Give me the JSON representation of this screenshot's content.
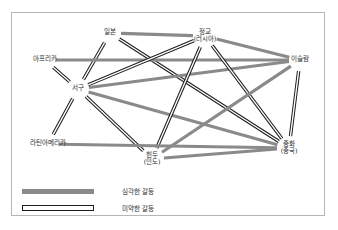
{
  "figure": {
    "title": "",
    "frame": {
      "stroke": "#b6b6b6"
    }
  },
  "colors": {
    "serious_conflict": "#8a8a8a",
    "weak_conflict_stroke": "#1d1d1d",
    "weak_conflict_fill": "#ffffff",
    "text": "#2b2b2b",
    "background": "#ffffff"
  },
  "legend": {
    "items": [
      {
        "key": "serious",
        "style": "solid-gray",
        "label": "심각한 갈등"
      },
      {
        "key": "weak",
        "style": "hollow-outline",
        "label": "미약한 갈등"
      }
    ]
  },
  "chart_data": {
    "type": "diagram",
    "subtype": "node-link-graph",
    "title": "",
    "nodes": [
      {
        "id": "japan",
        "label": "일본",
        "sub": "",
        "x": 110,
        "y": 33
      },
      {
        "id": "orthodox",
        "label": "정교",
        "sub": "(러시아)",
        "x": 205,
        "y": 36
      },
      {
        "id": "islam",
        "label": "이슬람",
        "sub": "",
        "x": 300,
        "y": 60
      },
      {
        "id": "africa",
        "label": "아프리카",
        "sub": "",
        "x": 45,
        "y": 60
      },
      {
        "id": "west",
        "label": "서구",
        "sub": "",
        "x": 78,
        "y": 89
      },
      {
        "id": "latin",
        "label": "라틴아메리카",
        "sub": "",
        "x": 48,
        "y": 144
      },
      {
        "id": "hindu",
        "label": "힌두",
        "sub": "(인도)",
        "x": 152,
        "y": 159
      },
      {
        "id": "sinic",
        "label": "중화",
        "sub": "(중국)",
        "x": 289,
        "y": 148
      }
    ],
    "edges": [
      {
        "source": "japan",
        "target": "orthodox",
        "type": "serious"
      },
      {
        "source": "japan",
        "target": "west",
        "type": "weak"
      },
      {
        "source": "japan",
        "target": "sinic",
        "type": "weak"
      },
      {
        "source": "africa",
        "target": "islam",
        "type": "serious"
      },
      {
        "source": "africa",
        "target": "west",
        "type": "weak"
      },
      {
        "source": "west",
        "target": "orthodox",
        "type": "weak"
      },
      {
        "source": "west",
        "target": "islam",
        "type": "serious"
      },
      {
        "source": "west",
        "target": "sinic",
        "type": "serious"
      },
      {
        "source": "west",
        "target": "hindu",
        "type": "weak"
      },
      {
        "source": "west",
        "target": "latin",
        "type": "weak"
      },
      {
        "source": "orthodox",
        "target": "hindu",
        "type": "weak"
      },
      {
        "source": "orthodox",
        "target": "sinic",
        "type": "weak"
      },
      {
        "source": "islam",
        "target": "sinic",
        "type": "weak"
      },
      {
        "source": "islam",
        "target": "hindu",
        "type": "serious"
      },
      {
        "source": "hindu",
        "target": "sinic",
        "type": "serious"
      },
      {
        "source": "orthodox",
        "target": "islam",
        "type": "serious"
      },
      {
        "source": "latin",
        "target": "sinic",
        "type": "serious"
      }
    ],
    "legend_position": "bottom-left"
  }
}
